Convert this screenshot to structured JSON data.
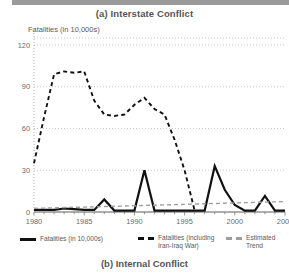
{
  "figure": {
    "title": "(a) Interstate Conflict",
    "caption": "(b) Internal Conflict",
    "y_axis_label": "Fatalities (in 10,000s)"
  },
  "legend": {
    "items": [
      {
        "label": "Fatalities (in 10,000s)",
        "style": "solid",
        "color": "#111111"
      },
      {
        "label": "Fatalities (including\nIran-Iraq War)",
        "style": "dashed",
        "color": "#111111"
      },
      {
        "label": "Estimated\nTrend",
        "style": "dashed",
        "color": "#9e9e9e"
      }
    ]
  },
  "chart_data": {
    "type": "line",
    "title": "(a) Interstate Conflict",
    "xlabel": "",
    "ylabel": "Fatalities (in 10,000s)",
    "xlim": [
      1980,
      2005
    ],
    "ylim": [
      0,
      125
    ],
    "yticks": [
      0,
      30,
      60,
      90,
      120
    ],
    "ytick_labels": [
      "0",
      "30",
      "60",
      "90",
      "120"
    ],
    "xticks": [
      1980,
      1985,
      1990,
      1995,
      2000,
      2005
    ],
    "xtick_labels": [
      "1980",
      "1985",
      "1990",
      "1995",
      "2000",
      "2005"
    ],
    "grid": true,
    "grid_style": "dotted",
    "legend_position": "below",
    "x": [
      1980,
      1981,
      1982,
      1983,
      1984,
      1985,
      1986,
      1987,
      1988,
      1989,
      1990,
      1991,
      1992,
      1993,
      1994,
      1995,
      1996,
      1997,
      1998,
      1999,
      2000,
      2001,
      2002,
      2003,
      2004,
      2005
    ],
    "series": [
      {
        "name": "Fatalities (in 10,000s)",
        "style": "solid",
        "color": "#111111",
        "width": 2.2,
        "values": [
          1.5,
          1.5,
          1.5,
          2.5,
          2.0,
          1.5,
          1.5,
          9.0,
          1.0,
          1.0,
          1.0,
          30.0,
          1.0,
          1.0,
          1.0,
          1.0,
          1.0,
          1.0,
          33.0,
          16.0,
          5.0,
          1.0,
          1.0,
          11.5,
          1.0,
          1.0
        ]
      },
      {
        "name": "Fatalities (including Iran-Iraq War)",
        "style": "dashed",
        "color": "#111111",
        "width": 1.9,
        "values": [
          35.0,
          68.0,
          99.0,
          101.0,
          100.0,
          101.0,
          80.0,
          70.0,
          69.0,
          70.0,
          77.0,
          82.0,
          74.0,
          70.0,
          52.0,
          30.0,
          1.0,
          null,
          null,
          null,
          null,
          null,
          null,
          null,
          null,
          null
        ]
      },
      {
        "name": "Estimated Trend",
        "style": "dashed",
        "color": "#9e9e9e",
        "width": 1.4,
        "values": [
          2.6,
          2.8,
          3.0,
          3.2,
          3.4,
          3.5,
          3.7,
          3.9,
          4.1,
          4.3,
          4.5,
          4.7,
          4.9,
          5.1,
          5.3,
          5.5,
          5.7,
          5.9,
          6.1,
          6.3,
          6.5,
          6.7,
          6.9,
          7.1,
          7.3,
          7.5
        ]
      }
    ]
  }
}
